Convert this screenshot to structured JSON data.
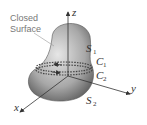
{
  "diagram": {
    "title_label_line1": "Closed",
    "title_label_line2": "Surface",
    "axes": {
      "z": "z",
      "y": "y",
      "x": "x"
    },
    "surfaces": [
      {
        "name": "S",
        "sub": "1"
      },
      {
        "name": "S",
        "sub": "2"
      }
    ],
    "curves": [
      {
        "name": "C",
        "sub": "1"
      },
      {
        "name": "C",
        "sub": "2"
      }
    ],
    "colors": {
      "surface_dark": "#555555",
      "surface_light": "#e0e0e0",
      "axis": "#333333"
    }
  }
}
